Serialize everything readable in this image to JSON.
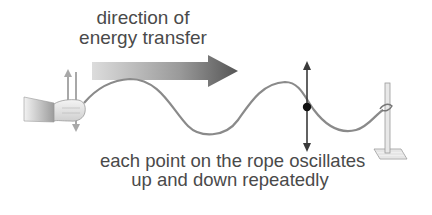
{
  "diagram": {
    "type": "transverse-wave-on-rope",
    "top_label": {
      "line1": "direction of",
      "line2": "energy transfer"
    },
    "bottom_label": {
      "line1": "each point on the rope oscillates",
      "line2": "up and down repeatedly"
    },
    "elements": {
      "hand": "hand holding rope end, moving up and down",
      "energy_arrow": "gradient arrow pointing right",
      "rope": "sinusoidal wave rope",
      "point_marker": "black dot on rope with double-headed vertical arrow",
      "stand": "clamp stand with rope tied to it"
    },
    "colors": {
      "text": "#4a4a4a",
      "rope": "#8a8a8a",
      "arrow_start": "#d8d8d8",
      "arrow_end": "#555555",
      "marker": "#111111",
      "oscillation_arrow": "#444444"
    }
  }
}
